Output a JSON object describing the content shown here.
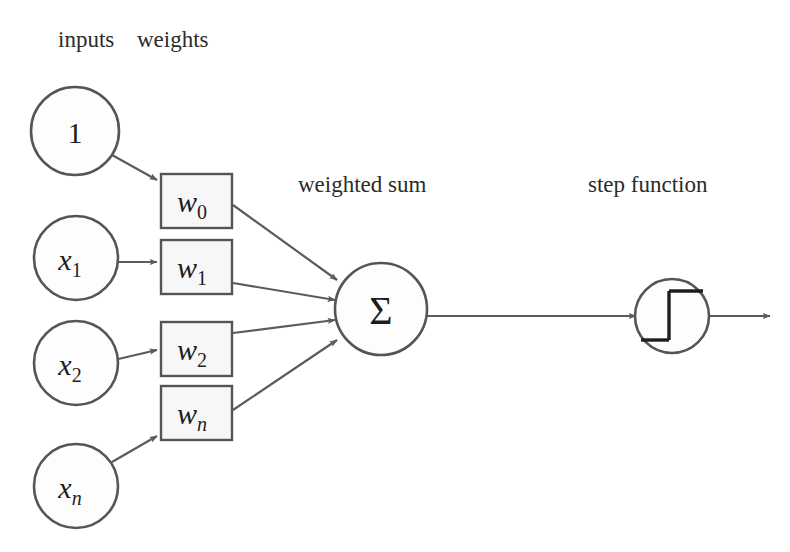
{
  "diagram": {
    "headers": {
      "inputs_label": "inputs",
      "weights_label": "weights",
      "weighted_sum_label": "weighted sum",
      "step_function_label": "step function"
    },
    "inputs": [
      {
        "name": "input-bias",
        "main": "1",
        "sub": "",
        "italic": false
      },
      {
        "name": "input-x1",
        "main": "x",
        "sub": "1",
        "italic": true
      },
      {
        "name": "input-x2",
        "main": "x",
        "sub": "2",
        "italic": true
      },
      {
        "name": "input-xn",
        "main": "x",
        "sub": "n",
        "italic": true
      }
    ],
    "weights": [
      {
        "name": "weight-w0",
        "main": "w",
        "sub": "0"
      },
      {
        "name": "weight-w1",
        "main": "w",
        "sub": "1"
      },
      {
        "name": "weight-w2",
        "main": "w",
        "sub": "2"
      },
      {
        "name": "weight-wn",
        "main": "w",
        "sub": "n"
      }
    ],
    "summation": {
      "symbol": "Σ",
      "name": "summation-node"
    },
    "activation": {
      "name": "step-function-node",
      "glyph": "heaviside-step"
    },
    "colors": {
      "background": "#ffffff",
      "stroke": "#555555",
      "text": "#1d1d1d",
      "label_text": "#2b2b2b",
      "node_fill": "#fdfdfd",
      "box_fill": "#f7f7f7"
    }
  }
}
